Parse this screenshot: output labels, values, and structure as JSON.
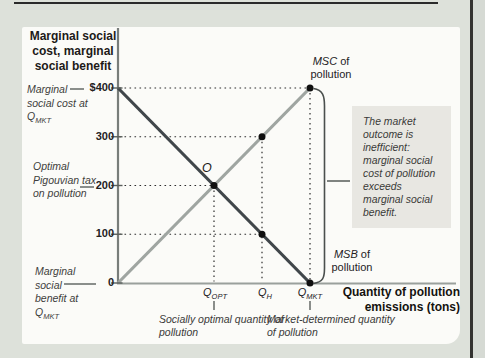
{
  "colors": {
    "msc_line": "#9fa5a1",
    "msb_line": "#40464a",
    "dot": "#101010",
    "axis_y": "#787d7a",
    "axis_x": "#9aa09c",
    "note_bg": "#e8e7e2",
    "page_bg": "#dde1da",
    "panel_bg": "#fbfbf8"
  },
  "y_axis": {
    "title": "Marginal social cost, marginal social benefit",
    "tick_labels": [
      "$400",
      "300",
      "200",
      "100",
      "0"
    ]
  },
  "x_axis": {
    "title": "Quantity of pollution emissions (tons)",
    "ticks": [
      {
        "base": "Q",
        "sub": "OPT"
      },
      {
        "base": "Q",
        "sub": "H"
      },
      {
        "base": "Q",
        "sub": "MKT"
      }
    ]
  },
  "left_labels": {
    "msc_at_qmkt": {
      "text": "Marginal social cost at Q",
      "sub": "MKT"
    },
    "pigouvian": "Optimal Pigouvian tax on pollution",
    "msb_at_qmkt": {
      "text": "Marginal social benefit at Q",
      "sub": "MKT"
    }
  },
  "bottom_labels": {
    "socially_optimal": "Socially optimal quantity of pollution",
    "market_determined": "Market-determined quantity of pollution"
  },
  "curve_labels": {
    "msc": {
      "abbr": "MSC",
      "rest": " of pollution"
    },
    "msb": {
      "abbr": "MSB",
      "rest": " of pollution"
    }
  },
  "note": "The market outcome is inefficient: marginal social cost of pollution exceeds marginal social benefit.",
  "point_label": "O",
  "chart_data": {
    "type": "line",
    "title": "",
    "xlabel": "Quantity of pollution emissions (tons)",
    "ylabel": "Marginal social cost, marginal social benefit",
    "xlim": [
      0,
      100
    ],
    "ylim": [
      0,
      400
    ],
    "yticks": [
      400,
      300,
      200,
      100,
      0
    ],
    "ytick_labels": [
      "$400",
      "300",
      "200",
      "100",
      "0"
    ],
    "x_key_points": {
      "Q_OPT": 50,
      "Q_H": 75,
      "Q_MKT": 100
    },
    "series": [
      {
        "name": "MSC of pollution",
        "color": "#9fa5a1",
        "points": [
          [
            0,
            0
          ],
          [
            100,
            400
          ]
        ]
      },
      {
        "name": "MSB of pollution",
        "color": "#40464a",
        "points": [
          [
            0,
            400
          ],
          [
            100,
            0
          ]
        ]
      }
    ],
    "dots": [
      [
        100,
        400
      ],
      [
        75,
        300
      ],
      [
        50,
        200
      ],
      [
        75,
        100
      ],
      [
        100,
        0
      ]
    ],
    "h_guides": [
      {
        "y": 400,
        "x_to": 100
      },
      {
        "y": 300,
        "x_to": 75
      },
      {
        "y": 200,
        "x_to": 50
      },
      {
        "y": 100,
        "x_to": 75
      }
    ],
    "v_guides": [
      {
        "x": 50,
        "y_from": 200
      },
      {
        "x": 75,
        "y_from": 300
      },
      {
        "x": 100,
        "y_from": 400
      }
    ],
    "bottom_tick_xs": [
      50,
      100
    ],
    "equilibrium": {
      "label": "O",
      "x": 50,
      "y": 200
    },
    "optimal_pigouvian_tax": 200,
    "msc_at_qmkt": 400,
    "msb_at_qmkt": 0,
    "grid": "dotted-guides-only",
    "legend_position": "inline-curve-labels"
  }
}
